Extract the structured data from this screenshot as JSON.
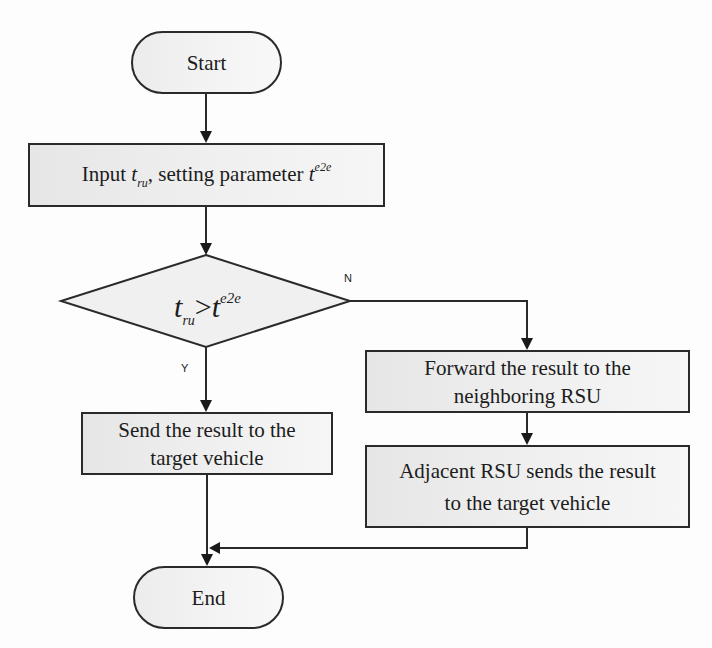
{
  "diagram": {
    "type": "flowchart",
    "nodes": {
      "start": {
        "shape": "terminator",
        "label": "Start"
      },
      "input": {
        "shape": "process",
        "prefix": "Input ",
        "var1": "t",
        "var1_sub": "ru",
        "middle": ", setting parameter ",
        "var2": "t",
        "var2_sup": "e2e"
      },
      "decision": {
        "shape": "decision",
        "lhs": "t",
        "lhs_sub": "ru",
        "op": ">",
        "rhs": "t",
        "rhs_sup": "e2e"
      },
      "send": {
        "shape": "process",
        "line1": "Send the result to the",
        "line2": "target vehicle"
      },
      "forward": {
        "shape": "process",
        "line1": "Forward the result to the",
        "line2": "neighboring RSU"
      },
      "adjacent": {
        "shape": "process",
        "line1": "Adjacent RSU sends the result",
        "line2": "to the target vehicle"
      },
      "end": {
        "shape": "terminator",
        "label": "End"
      }
    },
    "edge_labels": {
      "yes": "Y",
      "no": "N"
    },
    "edges": [
      {
        "from": "start",
        "to": "input"
      },
      {
        "from": "input",
        "to": "decision"
      },
      {
        "from": "decision",
        "to": "send",
        "label": "Y"
      },
      {
        "from": "decision",
        "to": "forward",
        "label": "N"
      },
      {
        "from": "forward",
        "to": "adjacent"
      },
      {
        "from": "send",
        "to": "end"
      },
      {
        "from": "adjacent",
        "to": "end"
      }
    ],
    "colors": {
      "stroke": "#2a2a2a",
      "fill": "#efefef",
      "background": "#fdfdfd"
    }
  }
}
